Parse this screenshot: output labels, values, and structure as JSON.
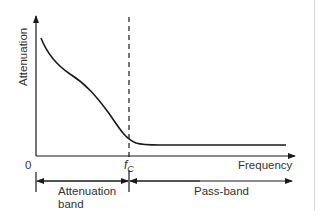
{
  "diagram": {
    "type": "filter-attenuation-characteristic",
    "y_axis_label": "Attenuation",
    "x_axis_label": "Frequency",
    "origin_label": "0",
    "cutoff_label": "f",
    "cutoff_subscript": "C",
    "bands": [
      {
        "label_line1": "Attenuation",
        "label_line2": "band"
      },
      {
        "label_line1": "Pass-band",
        "label_line2": ""
      }
    ],
    "colors": {
      "line": "#1a1a1a",
      "text": "#333333",
      "background": "#ffffff"
    }
  }
}
